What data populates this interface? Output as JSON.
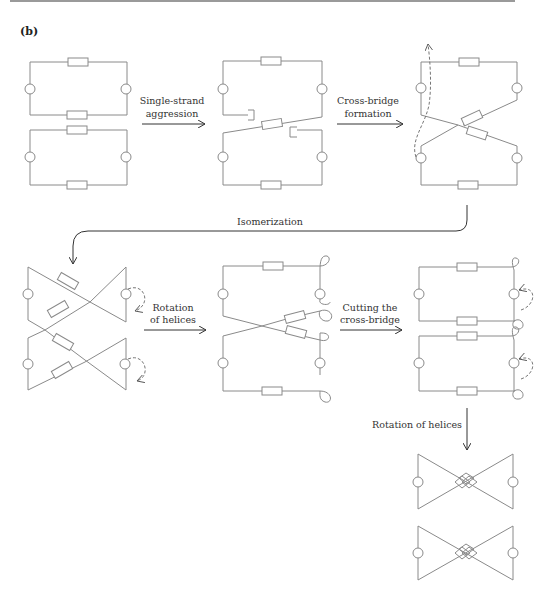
{
  "figure": {
    "panel_label": "(b)",
    "steps": [
      {
        "id": "single-strand-aggression",
        "label_line1": "Single-strand",
        "label_line2": "aggression"
      },
      {
        "id": "cross-bridge-formation",
        "label_line1": "Cross-bridge",
        "label_line2": "formation"
      },
      {
        "id": "isomerization",
        "label_line1": "Isomerization"
      },
      {
        "id": "rotation-of-helices-1",
        "label_line1": "Rotation",
        "label_line2": "of helices"
      },
      {
        "id": "cutting-cross-bridge",
        "label_line1": "Cutting the",
        "label_line2": "cross-bridge"
      },
      {
        "id": "rotation-of-helices-2",
        "label_line1": "Rotation of helices"
      }
    ],
    "colors": {
      "line": "#8a8a8a",
      "arrow": "#333333",
      "text": "#333333"
    }
  }
}
